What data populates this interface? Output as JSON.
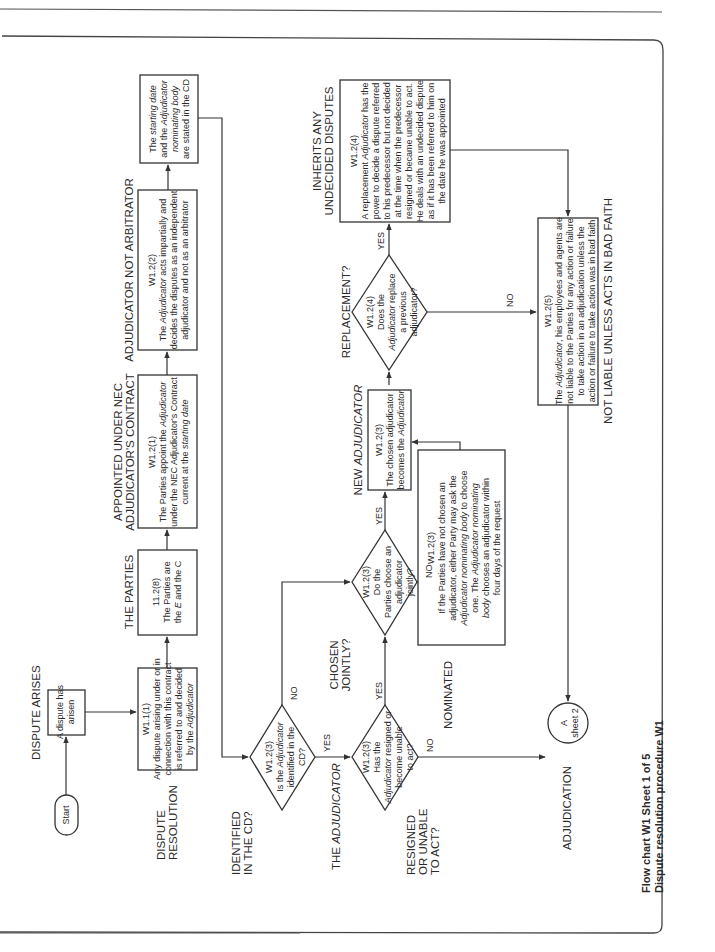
{
  "page": {
    "caption": {
      "line1": "Flow chart W1 Sheet 1 of 5",
      "line2": "Dispute resolution procedure W1"
    }
  },
  "stage_labels": {
    "dispute_arises": "DISPUTE ARISES",
    "the_parties": "THE PARTIES",
    "appointed_1": "APPOINTED UNDER NEC",
    "appointed_2": "ADJUDICATOR'S CONTRACT",
    "not_arbitrator": "ADJUDICATOR NOT ARBITRATOR",
    "dispute_resolution_1": "DISPUTE",
    "dispute_resolution_2": "RESOLUTION",
    "identified_1": "IDENTIFIED",
    "identified_2": "IN THE CD?",
    "the_adjudicator_1": "THE ",
    "the_adjudicator_2": "ADJUDICATOR",
    "resigned_1": "RESIGNED",
    "resigned_2": "OR UNABLE",
    "resigned_3": "TO ACT?",
    "chosen_1": "CHOSEN",
    "chosen_2": "JOINTLY?",
    "nominated": "NOMINATED",
    "new_adjudicator_1": "NEW ",
    "new_adjudicator_2": "ADJUDICATOR",
    "replacement": "REPLACEMENT?",
    "inherits_1": "INHERITS ANY",
    "inherits_2": "UNDECIDED DISPUTES",
    "not_liable": "NOT LIABLE UNLESS ACTS IN BAD FAITH",
    "adjudication": "ADJUDICATION"
  },
  "nodes": {
    "start": {
      "label": "Start"
    },
    "dispute_arisen": {
      "lines": [
        "A dispute has",
        "arisen"
      ]
    },
    "w1_1_1": {
      "ref": "W1.1(1)",
      "lines": [
        "Any dispute arising under or in",
        "connection with this contract",
        "is referred to and decided",
        "by the Adjudicator"
      ]
    },
    "c11_2_8": {
      "ref": "11.2(8)",
      "line1": "The Parties are",
      "line2_a": "the ",
      "line2_e": "E",
      "line2_b": " and the ",
      "line2_c": "C"
    },
    "w1_2_1": {
      "ref": "W1.2(1)",
      "line1_a": "The Parties appoint the ",
      "line1_b": "Adjudicator",
      "line2": "under the NEC Adjudicator's Contract",
      "line3_a": "current at the ",
      "line3_b": "starting date"
    },
    "w1_2_2": {
      "ref": "W1.2(2)",
      "line1_a": "The ",
      "line1_b": "Adjudicator",
      "line1_c": " acts impartially and",
      "line2": "decides the disputes as an independent",
      "line3": "adjudicator and not as an arbitrator"
    },
    "cd_box": {
      "line1_a": "The ",
      "line1_b": "starting date",
      "line2_a": "and the ",
      "line2_b": "Adjudicator",
      "line3": "nominating body",
      "line4": "are stated in the CD"
    },
    "d_identified": {
      "ref": "W1.2(3)",
      "line1_a": "Is the ",
      "line1_b": "Adjudicator",
      "line2": "identified in the",
      "line3": "CD?",
      "yes": "YES",
      "no": "NO"
    },
    "d_resigned": {
      "ref": "W1.2(3)",
      "line1": "Has the",
      "line2_a": "Adjudicator",
      "line2_b": " resigned or",
      "line3": "become unable",
      "line4": "to act?",
      "yes": "YES",
      "no": "NO"
    },
    "d_jointly": {
      "ref": "W1.2(3)",
      "line1": "Do the",
      "line2": "Parties choose an",
      "line3": "adjudicator",
      "line4": "jointly?",
      "yes": "YES",
      "no": "NO"
    },
    "w1_2_3_nominated": {
      "ref": "W1.2(3)",
      "line1": "If the Parties have not chosen an",
      "line2": "adjudicator, either Party may ask the",
      "line3_a": "Adjudicator nominating body",
      "line3_b": " to choose",
      "line4_a": "one. The ",
      "line4_b": "Adjudicator nominating",
      "line5_a": "body",
      "line5_b": " chooses an adjudicator within",
      "line6": "four days of the request"
    },
    "w1_2_3_new": {
      "ref": "W1.2(3)",
      "line1": "The chosen adjudicator",
      "line2_a": "becomes the ",
      "line2_b": "Adjudicator"
    },
    "d_replacement": {
      "ref": "W1.2(4)",
      "line1": "Does the",
      "line2_a": "Adjudicator",
      "line2_b": " replace",
      "line3": "a previous",
      "line4": "adjudicator?",
      "yes": "YES",
      "no": "NO"
    },
    "w1_2_4": {
      "ref": "W1.2(4)",
      "line1_a": "A replacement ",
      "line1_b": "Adjudicator",
      "line1_c": " has the",
      "line2": "power to decide a dispute referred",
      "line3": "to his predecessor but not decided",
      "line4": "at the time when the predecessor",
      "line5": "resigned or became unable to act.",
      "line6": "He deals with an undecided dispute",
      "line7": "as if it has been referred to him on",
      "line8": "the date he was appointed"
    },
    "w1_2_5": {
      "ref": "W1.2(5)",
      "line1_a": "The ",
      "line1_b": "Adjudicator",
      "line1_c": ", his employees and agents are",
      "line2": "not liable to the Parties for any action or failure",
      "line3": "to take action in an adjudication unless the",
      "line4": "action or failure to take action was in bad faith"
    },
    "connector_a": {
      "letter": "A",
      "sheet": "sheet 2"
    }
  }
}
